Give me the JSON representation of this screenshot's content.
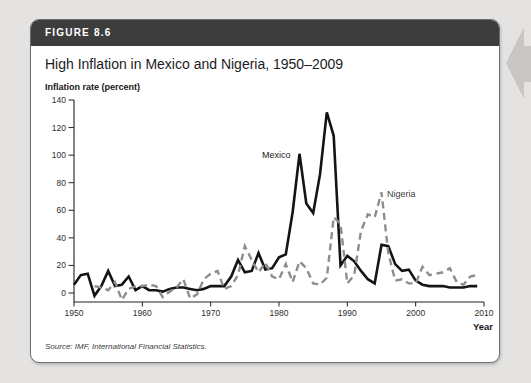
{
  "page": {
    "background_color": "#e4e3e1"
  },
  "figure": {
    "label": "FIGURE 8.6",
    "title": "High Inflation in Mexico and Nigeria, 1950–2009",
    "source": "Source: IMF, International Financial Statistics.",
    "header_bg_color": "#3d3d3d"
  },
  "icons": {
    "nav_arrow": "back-arrow-icon",
    "nav_arrow_color": "#c8c7c5"
  },
  "chart_data": {
    "type": "line",
    "title": "High Inflation in Mexico and Nigeria, 1950–2009",
    "ylabel": "Inflation rate (percent)",
    "xlabel": "Year",
    "xlim": [
      1950,
      2010
    ],
    "ylim": [
      0,
      140
    ],
    "yticks": [
      0,
      20,
      40,
      60,
      80,
      100,
      120,
      140
    ],
    "xticks": [
      1950,
      1960,
      1970,
      1980,
      1990,
      2000,
      2010
    ],
    "grid": false,
    "legend_position": "inline-annotations",
    "axis_color": "#222222",
    "tick_label_color": "#2e2e2e",
    "series": [
      {
        "name": "Mexico",
        "color": "#141414",
        "style": "solid",
        "stroke_width": 2.6,
        "start_year": 1950,
        "values": [
          6,
          13,
          14,
          -2,
          5,
          16,
          5,
          6,
          12,
          2,
          5,
          2,
          2,
          1,
          3,
          4,
          4,
          3,
          2,
          3,
          5,
          5,
          5,
          12,
          24,
          15,
          16,
          29,
          17,
          18,
          26,
          28,
          59,
          101,
          65,
          58,
          86,
          131,
          114,
          20,
          27,
          23,
          16,
          10,
          7,
          35,
          34,
          21,
          16,
          17,
          9,
          6,
          5,
          5,
          5,
          4,
          4,
          4,
          5,
          5
        ]
      },
      {
        "name": "Nigeria",
        "color": "#8d8d8d",
        "style": "dashed",
        "stroke_width": 2.4,
        "start_year": 1953,
        "values": [
          5,
          4,
          2,
          8,
          -5,
          3,
          5,
          5,
          6,
          5,
          -3,
          1,
          4,
          10,
          -4,
          -1,
          10,
          14,
          16,
          3,
          5,
          13,
          34,
          24,
          15,
          22,
          12,
          10,
          21,
          8,
          23,
          18,
          7,
          6,
          11,
          55,
          50,
          7,
          13,
          45,
          57,
          55,
          73,
          29,
          9,
          10,
          7,
          7,
          19,
          13,
          14,
          15,
          18,
          8,
          6,
          12,
          13
        ]
      }
    ],
    "annotations": [
      {
        "text": "Mexico",
        "year": 1977.5,
        "value": 98,
        "color": "#1a1a1a"
      },
      {
        "text": "Nigeria",
        "year": 1995.8,
        "value": 69.5,
        "color": "#3d3d3d"
      }
    ]
  }
}
